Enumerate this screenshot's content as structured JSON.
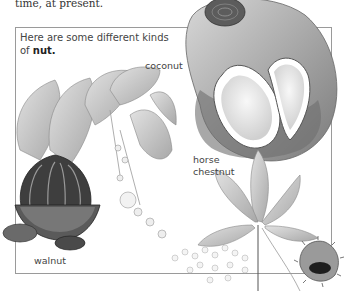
{
  "top_text": "time, at present.",
  "box": {
    "caption_prefix": "Here are some different kinds of ",
    "caption_keyword": "nut."
  },
  "labels": {
    "coconut": "coconut",
    "horse_chestnut_line1": "horse",
    "horse_chestnut_line2": "chestnut",
    "walnut": "walnut"
  },
  "illustrations": [
    {
      "name": "coconut",
      "description": "halved coconut in husk"
    },
    {
      "name": "cacao-walnut",
      "description": "pod with leaves and flowers"
    },
    {
      "name": "horse-chestnut",
      "description": "palmate leaf with conker and flower spike"
    }
  ],
  "colors": {
    "border": "#9a9a9a",
    "text": "#444444",
    "ink": "#555555"
  }
}
